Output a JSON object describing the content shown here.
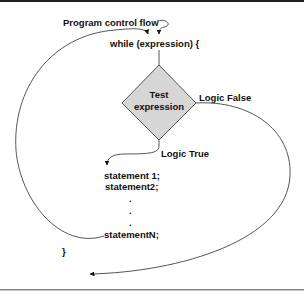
{
  "diagram": {
    "colors": {
      "line": "#555555",
      "border_top": "#222222",
      "border_bottom": "#888888",
      "diamond_fill": "#d6d6d6",
      "diamond_stroke": "#555555",
      "text": "#111111"
    },
    "labels": {
      "program_control_flow": "Program control flow",
      "while_header": "while (expression) {",
      "test_line1": "Test",
      "test_line2": "expression",
      "logic_false": "Logic False",
      "logic_true": "Logic True",
      "statement1": "statement 1;",
      "statement2": "statement2;",
      "dot": ".",
      "statementN": "statementN;",
      "closing_brace": "}"
    },
    "nodes": [
      {
        "id": "while",
        "type": "code-line",
        "text": "while (expression) {"
      },
      {
        "id": "test",
        "type": "decision",
        "text": "Test expression"
      },
      {
        "id": "body",
        "type": "code-block",
        "lines": [
          "statement 1;",
          "statement2;",
          ".",
          ".",
          ".",
          "statementN;"
        ]
      },
      {
        "id": "end",
        "type": "code-line",
        "text": "}"
      }
    ],
    "edges": [
      {
        "from": "entry",
        "to": "while",
        "label": "Program control flow"
      },
      {
        "from": "while",
        "to": "test",
        "label": ""
      },
      {
        "from": "test",
        "to": "body",
        "label": "Logic True"
      },
      {
        "from": "test",
        "to": "exit",
        "label": "Logic False"
      },
      {
        "from": "body",
        "to": "while",
        "label": ""
      }
    ]
  }
}
